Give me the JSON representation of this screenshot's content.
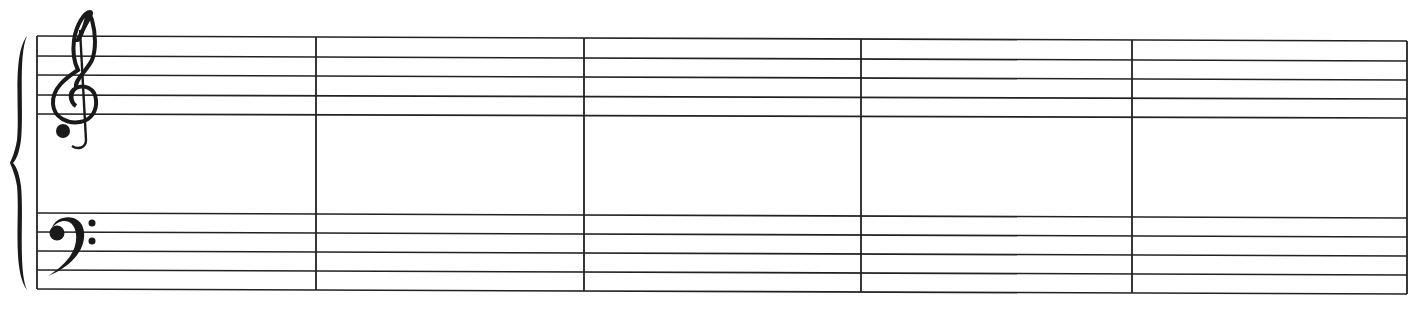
{
  "score": {
    "type": "grand-staff",
    "measures": 5,
    "staves": [
      {
        "name": "treble",
        "clef": "treble-clef",
        "clef_glyph": "𝄞",
        "lines": 5
      },
      {
        "name": "bass",
        "clef": "bass-clef",
        "clef_glyph": "𝄢",
        "lines": 5
      }
    ],
    "brace": "curly-brace",
    "colors": {
      "ink": "#222222",
      "paper": "#ffffff"
    }
  }
}
